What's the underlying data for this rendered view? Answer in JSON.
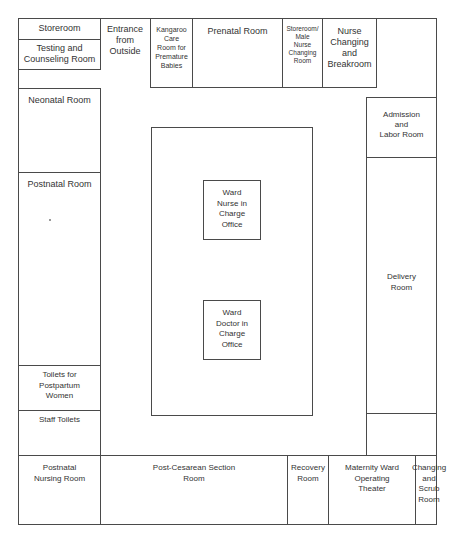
{
  "diagram": {
    "type": "floor-plan",
    "rooms": {
      "storeroom": "Storeroom",
      "testing_counseling": "Testing and\nCounseling Room",
      "entrance": "Entrance\nfrom\nOutside",
      "kangaroo_care": "Kangaroo\nCare\nRoom for\nPremature\nBabies",
      "prenatal": "Prenatal Room",
      "storeroom_male_nurse": "Storeroom/\nMale\nNurse\nChanging\nRoom",
      "nurse_changing_breakroom": "Nurse\nChanging\nand\nBreakroom",
      "neonatal": "Neonatal Room",
      "postnatal": "Postnatal Room",
      "toilets_postpartum": "Toilets for Postpartum\nWomen",
      "staff_toilets": "Staff Toilets",
      "ward_nurse_office": "Ward\nNurse in\nCharge\nOffice",
      "ward_doctor_office": "Ward\nDoctor in\nCharge\nOffice",
      "admission_labor": "Admission\nand\nLabor Room",
      "delivery": "Delivery\nRoom",
      "postnatal_nursing": "Postnatal\nNursing Room",
      "post_cesarean": "Post-Cesarean Section\nRoom",
      "recovery": "Recovery\nRoom",
      "operating_theater": "Maternity Ward\nOperating\nTheater",
      "changing_scrub": "Changing\nand\nScrub\nRoom"
    },
    "colors": {
      "line": "#4a4a4a",
      "text": "#333333",
      "background": "#ffffff"
    }
  }
}
